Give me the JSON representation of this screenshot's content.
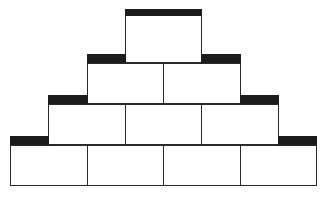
{
  "diagram": {
    "type": "block-pyramid",
    "rows": [
      {
        "level": 1,
        "blocks": 1,
        "caps": [
          "top"
        ]
      },
      {
        "level": 2,
        "blocks": 2,
        "caps": [
          "left-step",
          "right-step"
        ]
      },
      {
        "level": 3,
        "blocks": 3,
        "caps": [
          "left-step",
          "right-step"
        ]
      },
      {
        "level": 4,
        "blocks": 4,
        "caps": [
          "left-step",
          "right-step"
        ]
      }
    ],
    "colors": {
      "block_fill": "#ffffff",
      "block_border": "#2a2a2a",
      "cap_fill": "#1c1c1c",
      "background": "#ffffff"
    }
  }
}
